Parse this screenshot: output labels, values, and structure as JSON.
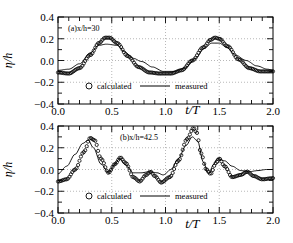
{
  "chart_data": [
    {
      "type": "line",
      "panel_label": "(a)x/h=30",
      "xlabel": "t/T",
      "ylabel": "η/h",
      "xlim": [
        0.0,
        2.0
      ],
      "ylim": [
        -0.4,
        0.4
      ],
      "xticks": [
        "0.0",
        "0.5",
        "1.0",
        "1.5",
        "2.0"
      ],
      "yticks": [
        "0.4",
        "0.2",
        "0.0",
        "-0.2",
        "-0.4"
      ],
      "grid": "dotted",
      "legend": [
        {
          "name": "calculated",
          "marker": "circle"
        },
        {
          "name": "measured",
          "marker": "line"
        }
      ],
      "series": [
        {
          "name": "calculated",
          "style": "circles",
          "x": [
            0.0,
            0.1,
            0.2,
            0.3,
            0.38,
            0.44,
            0.48,
            0.55,
            0.65,
            0.75,
            0.85,
            0.95,
            1.05,
            1.15,
            1.25,
            1.35,
            1.42,
            1.46,
            1.5,
            1.58,
            1.68,
            1.78,
            1.88,
            2.0
          ],
          "y": [
            -0.11,
            -0.12,
            -0.07,
            0.05,
            0.16,
            0.21,
            0.21,
            0.16,
            0.04,
            -0.06,
            -0.11,
            -0.12,
            -0.12,
            -0.09,
            0.0,
            0.12,
            0.19,
            0.21,
            0.2,
            0.13,
            0.01,
            -0.07,
            -0.1,
            -0.1
          ]
        },
        {
          "name": "measured",
          "style": "line",
          "x": [
            0.0,
            0.1,
            0.2,
            0.3,
            0.38,
            0.45,
            0.55,
            0.62,
            0.7,
            0.78,
            0.88,
            0.98,
            1.08,
            1.18,
            1.28,
            1.36,
            1.43,
            1.5,
            1.57,
            1.65,
            1.75,
            1.85,
            1.95,
            2.0
          ],
          "y": [
            -0.09,
            -0.08,
            -0.03,
            0.07,
            0.14,
            0.15,
            0.14,
            0.08,
            0.02,
            -0.01,
            -0.06,
            -0.1,
            -0.1,
            -0.07,
            0.02,
            0.11,
            0.16,
            0.16,
            0.12,
            0.05,
            0.0,
            -0.05,
            -0.08,
            -0.09
          ]
        }
      ]
    },
    {
      "type": "line",
      "panel_label": "(b)x/h=42.5",
      "xlabel": "t/T",
      "ylabel": "η/h",
      "xlim": [
        0.0,
        2.0
      ],
      "ylim": [
        -0.4,
        0.4
      ],
      "xticks": [
        "0.0",
        "0.5",
        "1.0",
        "1.5",
        "2.0"
      ],
      "yticks": [
        "0.4",
        "0.2",
        "0.0",
        "-0.2",
        "-0.4"
      ],
      "grid": "dotted",
      "legend": [
        {
          "name": "calculated",
          "marker": "circle"
        },
        {
          "name": "measured",
          "marker": "line"
        }
      ],
      "series": [
        {
          "name": "calculated",
          "style": "circles",
          "x": [
            0.0,
            0.08,
            0.16,
            0.24,
            0.3,
            0.34,
            0.4,
            0.47,
            0.53,
            0.58,
            0.63,
            0.7,
            0.76,
            0.82,
            0.86,
            0.9,
            0.96,
            1.04,
            1.12,
            1.2,
            1.26,
            1.29,
            1.33,
            1.38,
            1.42,
            1.47,
            1.5,
            1.55,
            1.62,
            1.7,
            1.76,
            1.82,
            1.9,
            2.0
          ],
          "y": [
            -0.11,
            -0.09,
            0.0,
            0.16,
            0.29,
            0.27,
            0.1,
            -0.03,
            0.05,
            0.11,
            0.06,
            -0.07,
            -0.11,
            -0.05,
            -0.02,
            -0.06,
            -0.12,
            -0.07,
            0.08,
            0.28,
            0.38,
            0.34,
            0.15,
            0.0,
            -0.04,
            0.06,
            0.1,
            0.03,
            -0.07,
            -0.05,
            -0.02,
            -0.06,
            -0.09,
            -0.08
          ]
        },
        {
          "name": "measured",
          "style": "line",
          "x": [
            0.0,
            0.08,
            0.16,
            0.23,
            0.28,
            0.33,
            0.4,
            0.47,
            0.53,
            0.57,
            0.63,
            0.7,
            0.78,
            0.85,
            0.92,
            0.98,
            1.05,
            1.12,
            1.19,
            1.25,
            1.3,
            1.35,
            1.4,
            1.45,
            1.48,
            1.55,
            1.62,
            1.7,
            1.78,
            1.86,
            1.94,
            2.0
          ],
          "y": [
            -0.04,
            0.03,
            0.14,
            0.24,
            0.27,
            0.2,
            0.05,
            -0.03,
            0.05,
            0.1,
            0.04,
            -0.03,
            -0.03,
            -0.02,
            -0.03,
            -0.05,
            0.0,
            0.1,
            0.22,
            0.3,
            0.26,
            0.07,
            -0.04,
            0.05,
            0.1,
            0.08,
            0.03,
            -0.01,
            -0.02,
            -0.01,
            0.0,
            0.0
          ]
        }
      ]
    }
  ],
  "labels": {
    "top": {
      "panel": "(a)x/h=30",
      "ylabel": "η/h",
      "xlabel": "t/T",
      "legend_calc": "calculated",
      "legend_meas": "measured",
      "xticks": [
        "0.0",
        "0.5",
        "1.0",
        "1.5",
        "2.0"
      ],
      "yticks": [
        "0.4",
        "0.2",
        "0.0",
        "-0.2",
        "-0.4"
      ]
    },
    "bottom": {
      "panel": "(b)x/h=42.5",
      "ylabel": "η/h",
      "xlabel": "t/T",
      "legend_calc": "calculated",
      "legend_meas": "measured",
      "xticks": [
        "0.0",
        "0.5",
        "1.0",
        "1.5",
        "2.0"
      ],
      "yticks": [
        "0.4",
        "0.2",
        "0.0",
        "-0.2",
        "-0.4"
      ]
    }
  }
}
